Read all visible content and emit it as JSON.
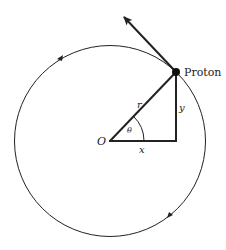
{
  "diagram": {
    "labels": {
      "particle": "Proton",
      "origin": "O",
      "radius": "r",
      "angle": "θ",
      "x_component": "x",
      "y_component": "y"
    },
    "colors": {
      "stroke": "#222222",
      "background": "#ffffff"
    },
    "geometry": {
      "circle_center": [
        110,
        140
      ],
      "circle_radius": 97,
      "proton_position": [
        176,
        72
      ],
      "velocity_arrow_tip": [
        122,
        15
      ]
    }
  }
}
